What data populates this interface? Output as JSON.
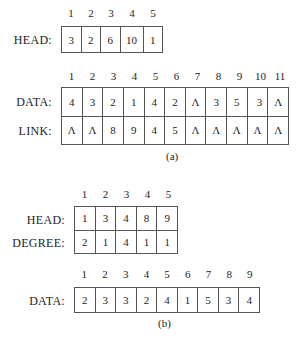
{
  "part_a": {
    "head": {
      "indices": [
        "1",
        "2",
        "3",
        "4",
        "5"
      ],
      "label": "HEAD:",
      "values": [
        "3",
        "2",
        "6",
        "10",
        "1"
      ]
    },
    "table": {
      "indices": [
        "1",
        "2",
        "3",
        "4",
        "5",
        "6",
        "7",
        "8",
        "9",
        "10",
        "11"
      ],
      "data_label": "DATA:",
      "link_label": "LINK:",
      "data": [
        "4",
        "3",
        "2",
        "1",
        "4",
        "2",
        "Λ",
        "3",
        "5",
        "3",
        "Λ"
      ],
      "link": [
        "Λ",
        "Λ",
        "8",
        "9",
        "4",
        "5",
        "Λ",
        "Λ",
        "Λ",
        "Λ",
        "Λ"
      ]
    },
    "caption": "(a)"
  },
  "part_b": {
    "head_degree": {
      "indices": [
        "1",
        "2",
        "3",
        "4",
        "5"
      ],
      "head_label": "HEAD:",
      "degree_label": "DEGREE:",
      "head": [
        "1",
        "3",
        "4",
        "8",
        "9"
      ],
      "degree": [
        "2",
        "1",
        "4",
        "1",
        "1"
      ]
    },
    "data": {
      "indices": [
        "1",
        "2",
        "3",
        "4",
        "5",
        "6",
        "7",
        "8",
        "9"
      ],
      "label": "DATA:",
      "values": [
        "2",
        "3",
        "3",
        "2",
        "4",
        "1",
        "5",
        "3",
        "4"
      ]
    },
    "caption": "(b)"
  }
}
